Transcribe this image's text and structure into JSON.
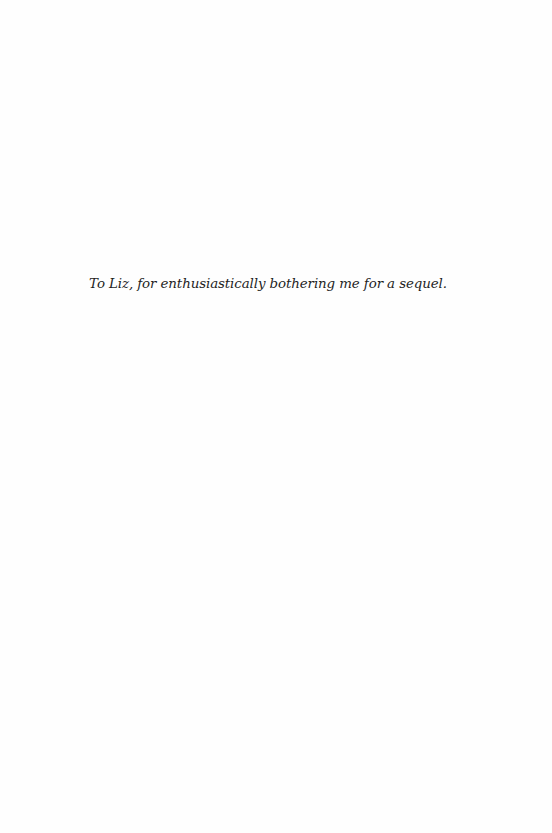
{
  "page": {
    "type": "dedication-page",
    "background_color": "#fefefe",
    "text_color": "#1e1e1e"
  },
  "dedication": {
    "text": "To Liz, for enthusiastically bothering me for a sequel."
  }
}
